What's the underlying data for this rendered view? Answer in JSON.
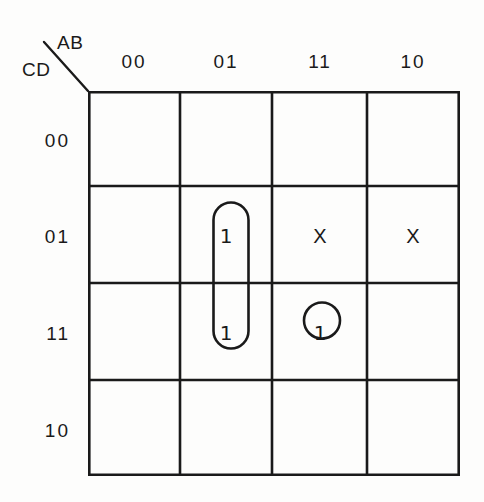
{
  "diagram": {
    "type": "karnaugh-map",
    "variables_top": "AB",
    "variables_left": "CD",
    "col_headers": [
      "00",
      "01",
      "11",
      "10"
    ],
    "row_headers": [
      "00",
      "01",
      "11",
      "10"
    ],
    "cells": [
      {
        "row": "00",
        "col": "00",
        "value": ""
      },
      {
        "row": "00",
        "col": "01",
        "value": ""
      },
      {
        "row": "00",
        "col": "11",
        "value": ""
      },
      {
        "row": "00",
        "col": "10",
        "value": ""
      },
      {
        "row": "01",
        "col": "00",
        "value": ""
      },
      {
        "row": "01",
        "col": "01",
        "value": "1"
      },
      {
        "row": "01",
        "col": "11",
        "value": "X"
      },
      {
        "row": "01",
        "col": "10",
        "value": "X"
      },
      {
        "row": "11",
        "col": "00",
        "value": ""
      },
      {
        "row": "11",
        "col": "01",
        "value": "1"
      },
      {
        "row": "11",
        "col": "11",
        "value": "1"
      },
      {
        "row": "11",
        "col": "10",
        "value": ""
      },
      {
        "row": "10",
        "col": "00",
        "value": ""
      },
      {
        "row": "10",
        "col": "01",
        "value": ""
      },
      {
        "row": "10",
        "col": "11",
        "value": ""
      },
      {
        "row": "10",
        "col": "10",
        "value": ""
      }
    ],
    "groups": [
      {
        "name": "vertical-pair-group",
        "shape": "pill",
        "covers": [
          "01/01",
          "11/01"
        ]
      },
      {
        "name": "single-cell-group",
        "shape": "circle",
        "covers": [
          "11/11"
        ]
      }
    ],
    "colors": {
      "ink": "#1a1a1a",
      "background": "#fdfdfc"
    }
  }
}
